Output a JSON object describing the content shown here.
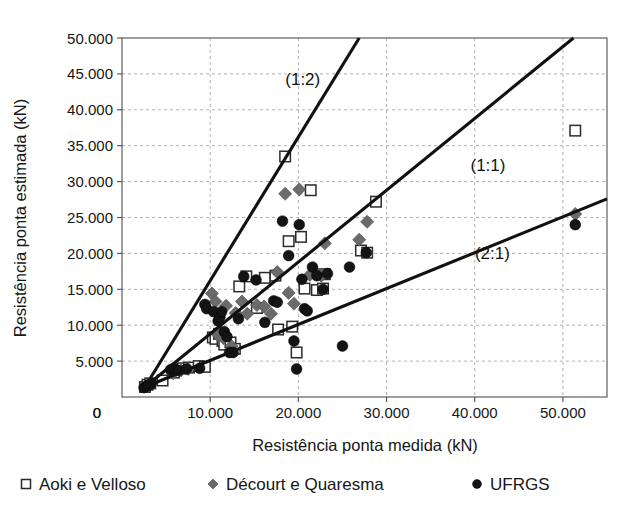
{
  "chart_data": {
    "type": "scatter",
    "title": "",
    "xlabel": "Resistência ponta medida (kN)",
    "ylabel": "Resistência ponta estimada (kN)",
    "xlim": [
      0,
      55000
    ],
    "ylim": [
      0,
      50000
    ],
    "grid": true,
    "legend_position": "bottom",
    "x_ticks": [
      {
        "value": 0,
        "label": "0"
      },
      {
        "value": 10000,
        "label": "10.000"
      },
      {
        "value": 20000,
        "label": "20.000"
      },
      {
        "value": 30000,
        "label": "30.000"
      },
      {
        "value": 40000,
        "label": "40.000"
      },
      {
        "value": 50000,
        "label": "50.000"
      }
    ],
    "y_ticks": [
      {
        "value": 0,
        "label": "0"
      },
      {
        "value": 5000,
        "label": "5.000"
      },
      {
        "value": 10000,
        "label": "10.000"
      },
      {
        "value": 15000,
        "label": "15.000"
      },
      {
        "value": 20000,
        "label": "20.000"
      },
      {
        "value": 25000,
        "label": "25.000"
      },
      {
        "value": 30000,
        "label": "30.000"
      },
      {
        "value": 35000,
        "label": "35.000"
      },
      {
        "value": 40000,
        "label": "40.000"
      },
      {
        "value": 45000,
        "label": "45.000"
      },
      {
        "value": 50000,
        "label": "50.000"
      }
    ],
    "reference_lines": [
      {
        "name": "one-to-two",
        "label": "(1:2)",
        "slope": 2.0,
        "label_x": 20500,
        "label_y": 43500
      },
      {
        "name": "one-to-one",
        "label": "(1:1)",
        "slope": 1.0,
        "label_x": 41500,
        "label_y": 31500
      },
      {
        "name": "two-to-one",
        "label": "(2:1)",
        "slope": 0.5,
        "label_x": 42000,
        "label_y": 19200
      }
    ],
    "series": [
      {
        "name": "Aoki e Velloso",
        "marker": "open-square",
        "color": "#ffffff",
        "edge_color": "#2b2b2b",
        "points": [
          [
            2600,
            1400
          ],
          [
            2900,
            1700
          ],
          [
            3200,
            1900
          ],
          [
            4600,
            2300
          ],
          [
            5900,
            3400
          ],
          [
            6900,
            4000
          ],
          [
            7600,
            4100
          ],
          [
            8700,
            4300
          ],
          [
            9400,
            4200
          ],
          [
            10300,
            8300
          ],
          [
            10600,
            8100
          ],
          [
            11000,
            8800
          ],
          [
            11400,
            7800
          ],
          [
            11600,
            7300
          ],
          [
            12300,
            7600
          ],
          [
            12800,
            6700
          ],
          [
            13300,
            15400
          ],
          [
            14100,
            16800
          ],
          [
            15300,
            12400
          ],
          [
            16200,
            16600
          ],
          [
            17400,
            16900
          ],
          [
            17700,
            9400
          ],
          [
            18500,
            33500
          ],
          [
            18900,
            21700
          ],
          [
            19300,
            9800
          ],
          [
            19800,
            6200
          ],
          [
            20300,
            22300
          ],
          [
            20700,
            15100
          ],
          [
            21400,
            28800
          ],
          [
            22100,
            14900
          ],
          [
            22800,
            15100
          ],
          [
            23000,
            17100
          ],
          [
            27100,
            20400
          ],
          [
            27800,
            20100
          ],
          [
            28800,
            27200
          ],
          [
            51400,
            37100
          ]
        ]
      },
      {
        "name": "Décourt e Quaresma",
        "marker": "gray-diamond",
        "color": "#6b6b6b",
        "points": [
          [
            2700,
            1500
          ],
          [
            3100,
            1800
          ],
          [
            5800,
            3300
          ],
          [
            6700,
            3700
          ],
          [
            7500,
            3900
          ],
          [
            10200,
            14400
          ],
          [
            10600,
            13300
          ],
          [
            10900,
            8600
          ],
          [
            11200,
            9000
          ],
          [
            11500,
            8200
          ],
          [
            11800,
            12700
          ],
          [
            12400,
            7100
          ],
          [
            12900,
            11700
          ],
          [
            13600,
            13300
          ],
          [
            14200,
            11600
          ],
          [
            15300,
            12800
          ],
          [
            16100,
            12600
          ],
          [
            16900,
            11600
          ],
          [
            17600,
            17400
          ],
          [
            18500,
            28300
          ],
          [
            18900,
            14500
          ],
          [
            19500,
            13000
          ],
          [
            20100,
            28900
          ],
          [
            21300,
            17000
          ],
          [
            22100,
            17200
          ],
          [
            22600,
            16900
          ],
          [
            23000,
            21400
          ],
          [
            26900,
            21900
          ],
          [
            27800,
            24400
          ],
          [
            51400,
            25500
          ]
        ]
      },
      {
        "name": "UFRGS",
        "marker": "black-circle",
        "color": "#141414",
        "points": [
          [
            2500,
            1300
          ],
          [
            2800,
            1500
          ],
          [
            3000,
            1700
          ],
          [
            3300,
            1900
          ],
          [
            5500,
            3800
          ],
          [
            5900,
            4000
          ],
          [
            6400,
            3700
          ],
          [
            7300,
            3900
          ],
          [
            8800,
            4000
          ],
          [
            9400,
            12900
          ],
          [
            9600,
            12300
          ],
          [
            10400,
            11900
          ],
          [
            10900,
            10600
          ],
          [
            11100,
            11100
          ],
          [
            11300,
            11900
          ],
          [
            11600,
            9100
          ],
          [
            11900,
            8400
          ],
          [
            12200,
            6200
          ],
          [
            12600,
            6200
          ],
          [
            13200,
            10900
          ],
          [
            13800,
            16800
          ],
          [
            15200,
            16300
          ],
          [
            16200,
            10400
          ],
          [
            17200,
            13400
          ],
          [
            17600,
            13200
          ],
          [
            18200,
            24500
          ],
          [
            18900,
            19700
          ],
          [
            19500,
            7800
          ],
          [
            19800,
            3900
          ],
          [
            20100,
            24000
          ],
          [
            20400,
            16400
          ],
          [
            20700,
            12300
          ],
          [
            21000,
            12000
          ],
          [
            21600,
            18100
          ],
          [
            22100,
            16900
          ],
          [
            22800,
            15000
          ],
          [
            23300,
            17200
          ],
          [
            25000,
            7100
          ],
          [
            25800,
            18100
          ],
          [
            27700,
            20100
          ],
          [
            51400,
            24000
          ]
        ]
      }
    ]
  },
  "legend": {
    "entries": [
      {
        "label": "Aoki e Velloso",
        "marker": "open-square"
      },
      {
        "label": "Décourt e Quaresma",
        "marker": "gray-diamond"
      },
      {
        "label": "UFRGS",
        "marker": "black-circle"
      }
    ]
  }
}
